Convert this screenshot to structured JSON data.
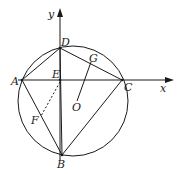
{
  "diagram": {
    "type": "geometry",
    "axes": {
      "x_label": "x",
      "y_label": "y"
    },
    "points": {
      "A": {
        "label": "A",
        "x": 22,
        "y": 80
      },
      "B": {
        "label": "B",
        "x": 62,
        "y": 155
      },
      "C": {
        "label": "C",
        "x": 122,
        "y": 80
      },
      "D": {
        "label": "D",
        "x": 60,
        "y": 48
      },
      "E": {
        "label": "E",
        "x": 60,
        "y": 80
      },
      "F": {
        "label": "F",
        "x": 37,
        "y": 116
      },
      "G": {
        "label": "G",
        "x": 91,
        "y": 60
      },
      "O": {
        "label": "O",
        "x": 76,
        "y": 101
      }
    },
    "circle": {
      "cx": 73,
      "cy": 101,
      "r": 55
    },
    "segments": [
      "AD",
      "DC",
      "AC",
      "AB",
      "BC",
      "DB",
      "OG"
    ],
    "dashed_segments": [
      "EF"
    ],
    "colors": {
      "stroke": "#1a1a1a",
      "background": "#ffffff"
    }
  }
}
